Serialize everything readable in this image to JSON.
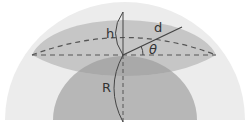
{
  "diagram": {
    "labels": {
      "h": "h",
      "d": "d",
      "theta": "θ",
      "R": "R"
    },
    "colors": {
      "background": "#ffffff",
      "outer_disk": "#ececec",
      "inner_disk": "#b7b7b7",
      "cap": "#c6c6c6",
      "overlap": "#a9a9a9",
      "lines": "#444444",
      "dashes": "#555555"
    }
  }
}
